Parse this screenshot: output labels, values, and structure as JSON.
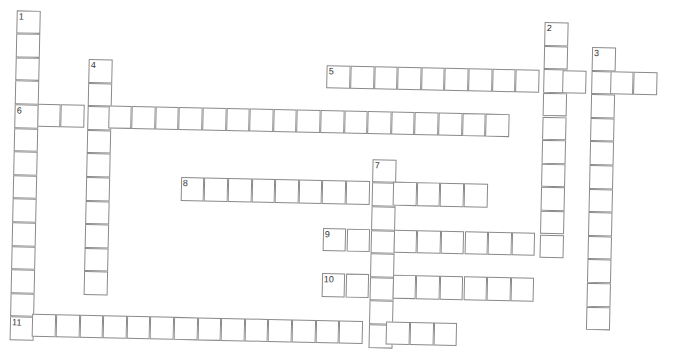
{
  "puzzle": {
    "cell_size": 23.6,
    "line_color": "#8a8a8a",
    "words": [
      {
        "number": "1",
        "direction": "down",
        "x": 17.2,
        "y": 9.6,
        "length": 14
      },
      {
        "number": "2",
        "direction": "down",
        "x": 545.4,
        "y": 10.1,
        "length": 10
      },
      {
        "number": "3",
        "direction": "down",
        "x": 593.0,
        "y": 34.0,
        "length": 12
      },
      {
        "number": "4",
        "direction": "down",
        "x": 90.3,
        "y": 57.0,
        "length": 10
      },
      {
        "number": "5",
        "direction": "across",
        "x": 328.4,
        "y": 57.9,
        "length": 14
      },
      {
        "number": "6",
        "direction": "across",
        "x": 16.2,
        "y": 102.7,
        "length": 21
      },
      {
        "number": "7",
        "direction": "down",
        "x": 376.4,
        "y": 150.8,
        "length": 8
      },
      {
        "number": "8",
        "direction": "across",
        "x": 184.8,
        "y": 173.0,
        "length": 13
      },
      {
        "number": "9",
        "direction": "across",
        "x": 327.9,
        "y": 220.9,
        "length": 10
      },
      {
        "number": "10",
        "direction": "across",
        "x": 327.9,
        "y": 266.0,
        "length": 9
      },
      {
        "number": "11",
        "direction": "across",
        "x": 15.8,
        "y": 312.7,
        "length": 19
      }
    ]
  }
}
